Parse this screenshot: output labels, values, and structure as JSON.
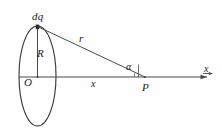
{
  "figure": {
    "background_color": "#fefefe",
    "stroke_color": "#3a3a3a",
    "labels": {
      "charge_element": "dq",
      "radius": "R",
      "center": "O",
      "distance_to_point": "r",
      "axial_distance": "x",
      "angle": "α",
      "field_point": "P",
      "axis": "x"
    },
    "bleed_through": {
      "mark_1": "— — —",
      "mark_2": "— — — —",
      "mark_3": "— —",
      "mark_4": "— — —",
      "mark_5": "— — — —",
      "mark_6": "—"
    }
  },
  "geometry": {
    "ring": {
      "shape": "ellipse",
      "center_x": 37.5,
      "center_y": 76,
      "radius_x": 18.5,
      "radius_y": 50
    },
    "points": {
      "O": {
        "x": 37.5,
        "y": 76,
        "label": "O"
      },
      "dq": {
        "x": 37.5,
        "y": 26,
        "label": "dq"
      },
      "P": {
        "x": 145,
        "y": 77,
        "label": "P"
      }
    },
    "segments": [
      {
        "name": "radius",
        "from": "O",
        "to": "dq",
        "label": "R"
      },
      {
        "name": "hypotenuse",
        "from": "dq",
        "to": "P",
        "label": "r"
      },
      {
        "name": "axis-distance",
        "from": "O",
        "to": "P",
        "label": "x"
      }
    ],
    "axis": {
      "from_x": 19,
      "to_x": 212,
      "y": 77,
      "arrow": true,
      "label": "x"
    },
    "angle_marker": {
      "at": "P",
      "label": "α",
      "between": [
        "hypotenuse",
        "axis"
      ]
    }
  }
}
